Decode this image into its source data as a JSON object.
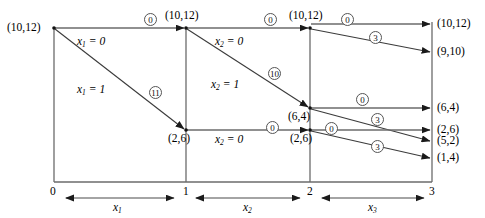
{
  "figure": {
    "type": "network-diagram"
  },
  "axis": {
    "tick_labels": [
      "0",
      "1",
      "2",
      "3"
    ],
    "stage_labels": [
      "x₁",
      "x₂",
      "x₃"
    ],
    "stage_label_base": "x",
    "stage_label_subs": [
      "1",
      "2",
      "3"
    ]
  },
  "nodes": [
    {
      "id": "n0",
      "label": "(10,12)",
      "stage": 0,
      "side": "left"
    },
    {
      "id": "n1a",
      "label": "(10,12)",
      "stage": 1,
      "side": "above"
    },
    {
      "id": "n1b",
      "label": "(2,6)",
      "stage": 1,
      "side": "below"
    },
    {
      "id": "n2a",
      "label": "(10,12)",
      "stage": 2,
      "side": "above"
    },
    {
      "id": "n2b",
      "label": "(6,4)",
      "stage": 2,
      "side": "below"
    },
    {
      "id": "n2c",
      "label": "(2,6)",
      "stage": 2,
      "side": "below"
    },
    {
      "id": "n3a",
      "label": "(10,12)",
      "stage": 3,
      "side": "right"
    },
    {
      "id": "n3b",
      "label": "(9,10)",
      "stage": 3,
      "side": "right"
    },
    {
      "id": "n3c",
      "label": "(6,4)",
      "stage": 3,
      "side": "right"
    },
    {
      "id": "n3d",
      "label": "(2,6)",
      "stage": 3,
      "side": "right"
    },
    {
      "id": "n3e",
      "label": "(5,2)",
      "stage": 3,
      "side": "right"
    },
    {
      "id": "n3f",
      "label": "(1,4)",
      "stage": 3,
      "side": "right"
    }
  ],
  "edges": [
    {
      "from": "n0",
      "to": "n1a",
      "cost": "0",
      "decision_base": "x",
      "decision_sub": "1",
      "decision_value": "0"
    },
    {
      "from": "n0",
      "to": "n1b",
      "cost": "11",
      "decision_base": "x",
      "decision_sub": "1",
      "decision_value": "1"
    },
    {
      "from": "n1a",
      "to": "n2a",
      "cost": "0",
      "decision_base": "x",
      "decision_sub": "2",
      "decision_value": "0"
    },
    {
      "from": "n1a",
      "to": "n2b",
      "cost": "10",
      "decision_base": "x",
      "decision_sub": "2",
      "decision_value": "1"
    },
    {
      "from": "n1b",
      "to": "n2c",
      "cost": "0",
      "decision_base": "x",
      "decision_sub": "2",
      "decision_value": "0"
    },
    {
      "from": "n2a",
      "to": "n3a",
      "cost": "0",
      "decision_base": "x",
      "decision_sub": "3",
      "decision_value": "0"
    },
    {
      "from": "n2a",
      "to": "n3b",
      "cost": "3",
      "decision_base": "x",
      "decision_sub": "3",
      "decision_value": "1"
    },
    {
      "from": "n2b",
      "to": "n3c",
      "cost": "0",
      "decision_base": "x",
      "decision_sub": "3",
      "decision_value": "0"
    },
    {
      "from": "n2b",
      "to": "n3e",
      "cost": "3",
      "decision_base": "x",
      "decision_sub": "3",
      "decision_value": "1"
    },
    {
      "from": "n2c",
      "to": "n3d",
      "cost": "0",
      "decision_base": "x",
      "decision_sub": "3",
      "decision_value": "0"
    },
    {
      "from": "n2c",
      "to": "n3f",
      "cost": "3",
      "decision_base": "x",
      "decision_sub": "3",
      "decision_value": "1"
    }
  ],
  "decision_labels": [
    {
      "id": "d1",
      "base": "x",
      "sub": "1",
      "value": "0"
    },
    {
      "id": "d2",
      "base": "x",
      "sub": "1",
      "value": "1"
    },
    {
      "id": "d3",
      "base": "x",
      "sub": "2",
      "value": "0"
    },
    {
      "id": "d4",
      "base": "x",
      "sub": "2",
      "value": "1"
    },
    {
      "id": "d5",
      "base": "x",
      "sub": "2",
      "value": "0"
    }
  ],
  "cost_badges": [
    {
      "id": "c1",
      "text": "0"
    },
    {
      "id": "c2",
      "text": "11"
    },
    {
      "id": "c3",
      "text": "0"
    },
    {
      "id": "c4",
      "text": "10"
    },
    {
      "id": "c5",
      "text": "0"
    },
    {
      "id": "c6",
      "text": "0"
    },
    {
      "id": "c7",
      "text": "3"
    },
    {
      "id": "c8",
      "text": "0"
    },
    {
      "id": "c9",
      "text": "3"
    },
    {
      "id": "c10",
      "text": "0"
    },
    {
      "id": "c11",
      "text": "3"
    }
  ],
  "node_texts": {
    "n0": "(10,12)",
    "n1a": "(10,12)",
    "n1b": "(2,6)",
    "n2a": "(10,12)",
    "n2b": "(6,4)",
    "n2c": "(2,6)",
    "n3a": "(10,12)",
    "n3b": "(9,10)",
    "n3c": "(6,4)",
    "n3d": "(2,6)",
    "n3e": "(5,2)",
    "n3f": "(1,4)"
  },
  "colors": {
    "line": "#6b6b6b",
    "arrow": "#1a1a1a",
    "text": "#000000",
    "badge_border": "#555555",
    "background": "#ffffff"
  }
}
